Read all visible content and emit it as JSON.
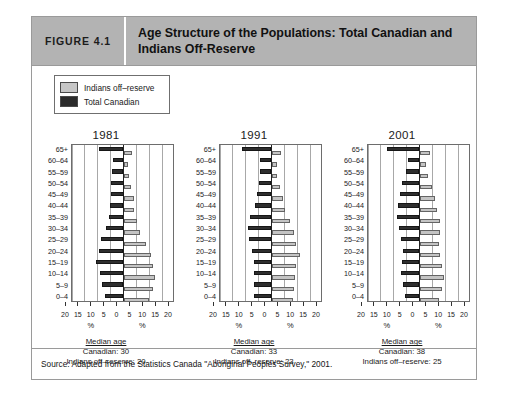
{
  "figure": {
    "number_label": "FIGURE 4.1",
    "title": "Age Structure of the Populations: Total Canadian and Indians Off-Reserve"
  },
  "legend": {
    "items": [
      {
        "label": "Indians off–reserve",
        "color": "#c4c4c4",
        "key": "off_reserve"
      },
      {
        "label": "Total Canadian",
        "color": "#2e2e2e",
        "key": "total_canadian"
      }
    ]
  },
  "axis": {
    "age_groups": [
      "65+",
      "60–64",
      "55–59",
      "50–54",
      "45–49",
      "40–44",
      "35–39",
      "30–34",
      "25–29",
      "20–24",
      "15–19",
      "10–14",
      "5–9",
      "0–4"
    ],
    "x_ticks": [
      20,
      15,
      10,
      5,
      0,
      5,
      10,
      15,
      20
    ],
    "x_unit_left": "%",
    "x_unit_right": "%",
    "x_max": 20
  },
  "median_labels": {
    "heading": "Median age",
    "canadian_prefix": "Canadian: ",
    "offreserve_prefix": "Indians off–reserve: "
  },
  "source": {
    "text": "Source: Adapted from the Statistics Canada \"Aboriginal Peoples Survey,\" 2001."
  },
  "chart_data": {
    "type": "bar",
    "subtype": "population-pyramid",
    "title": "Age Structure of the Populations: Total Canadian and Indians Off-Reserve",
    "xlabel": "%",
    "ylabel": "Age group",
    "xlim": [
      0,
      20
    ],
    "grid": true,
    "legend_position": "top-left",
    "note": "Mirrored pyramid: Total Canadian plotted leftwards, Indians off-reserve plotted rightwards; values are percent of population.",
    "categories": [
      "65+",
      "60–64",
      "55–59",
      "50–54",
      "45–49",
      "40–44",
      "35–39",
      "30–34",
      "25–29",
      "20–24",
      "15–19",
      "10–14",
      "5–9",
      "0–4"
    ],
    "panels": [
      {
        "year": "1981",
        "median_canadian": 30,
        "median_offreserve": 20,
        "series": [
          {
            "name": "Total Canadian",
            "side": "left",
            "color": "#2e2e2e",
            "values": [
              9.6,
              4.2,
              4.6,
              5.0,
              5.0,
              5.3,
              5.7,
              6.9,
              8.9,
              9.5,
              10.5,
              9.0,
              8.3,
              7.3
            ]
          },
          {
            "name": "Indians off–reserve",
            "side": "right",
            "color": "#c4c4c4",
            "values": [
              3.4,
              1.8,
              2.2,
              2.9,
              3.9,
              4.2,
              5.3,
              6.6,
              8.6,
              10.8,
              11.4,
              12.3,
              11.6,
              9.8
            ]
          }
        ]
      },
      {
        "year": "1991",
        "median_canadian": 33,
        "median_offreserve": 23,
        "series": [
          {
            "name": "Total Canadian",
            "side": "left",
            "color": "#2e2e2e",
            "values": [
              11.4,
              4.3,
              4.3,
              4.7,
              5.6,
              6.6,
              8.4,
              9.3,
              8.9,
              7.4,
              6.9,
              6.8,
              6.8,
              6.9
            ]
          },
          {
            "name": "Indians off–reserve",
            "side": "right",
            "color": "#c4c4c4",
            "values": [
              3.6,
              2.0,
              2.3,
              3.2,
              4.3,
              5.3,
              7.0,
              8.9,
              9.7,
              10.9,
              9.6,
              9.3,
              8.7,
              8.2
            ]
          }
        ]
      },
      {
        "year": "2001",
        "median_canadian": 38,
        "median_offreserve": 25,
        "series": [
          {
            "name": "Total Canadian",
            "side": "left",
            "color": "#2e2e2e",
            "values": [
              12.7,
              4.6,
              5.4,
              6.7,
              7.6,
              8.3,
              8.6,
              8.1,
              7.1,
              6.6,
              6.9,
              7.0,
              6.3,
              5.6
            ]
          },
          {
            "name": "Indians off–reserve",
            "side": "right",
            "color": "#c4c4c4",
            "values": [
              4.2,
              2.5,
              3.3,
              4.7,
              6.1,
              6.8,
              8.0,
              8.0,
              7.6,
              8.0,
              8.8,
              9.6,
              8.7,
              7.7
            ]
          }
        ]
      }
    ]
  }
}
